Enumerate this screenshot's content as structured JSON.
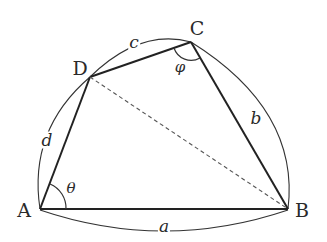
{
  "diagram": {
    "type": "cyclic-like quadrilateral with diagonal",
    "vertices": [
      {
        "id": "A",
        "label": "A",
        "x": 40,
        "y": 209
      },
      {
        "id": "B",
        "label": "B",
        "x": 288,
        "y": 209
      },
      {
        "id": "C",
        "label": "C",
        "x": 191,
        "y": 42
      },
      {
        "id": "D",
        "label": "D",
        "x": 90,
        "y": 77
      }
    ],
    "sides": [
      {
        "from": "A",
        "to": "B",
        "label": "a"
      },
      {
        "from": "B",
        "to": "C",
        "label": "b"
      },
      {
        "from": "C",
        "to": "D",
        "label": "c"
      },
      {
        "from": "D",
        "to": "A",
        "label": "d"
      }
    ],
    "diagonal": {
      "from": "D",
      "to": "B",
      "style": "dashed"
    },
    "angles": [
      {
        "vertex": "A",
        "label": "θ"
      },
      {
        "vertex": "C",
        "label": "φ"
      }
    ],
    "colors": {
      "stroke": "#2a2a2a",
      "background": "#ffffff"
    }
  }
}
